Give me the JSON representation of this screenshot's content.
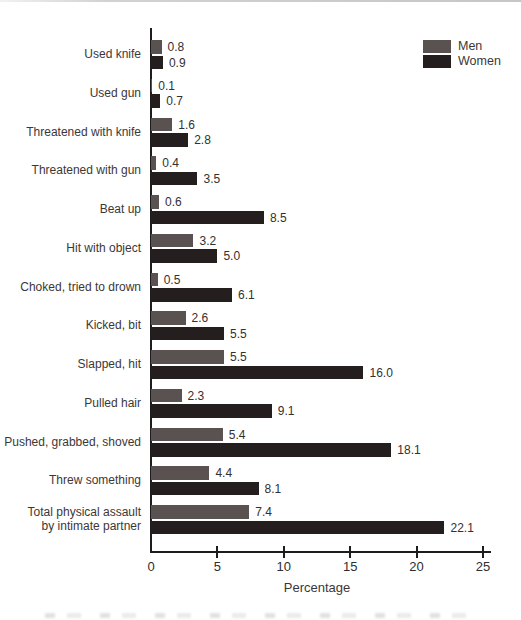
{
  "page": {
    "background": "#ffffff",
    "top_rule_color": "#c6c6c6",
    "axis_color": "#1d1d1d"
  },
  "legend": {
    "items": [
      {
        "label": "Men",
        "color": "#5a5151"
      },
      {
        "label": "Women",
        "color": "#241e1e"
      }
    ]
  },
  "chart_data": {
    "type": "bar",
    "orientation": "horizontal",
    "title": "",
    "xlabel": "Percentage",
    "ylabel": "",
    "xlim": [
      0,
      25
    ],
    "xticks": [
      0,
      5,
      10,
      15,
      20,
      25
    ],
    "grid": false,
    "legend_position": "top-right",
    "value_labels": true,
    "categories": [
      "Used knife",
      "Used gun",
      "Threatened with knife",
      "Threatened with gun",
      "Beat up",
      "Hit with object",
      "Choked, tried to drown",
      "Kicked, bit",
      "Slapped, hit",
      "Pulled hair",
      "Pushed, grabbed, shoved",
      "Threw something",
      "Total physical assault\nby intimate partner"
    ],
    "series": [
      {
        "name": "Men",
        "color": "#5a5151",
        "values": [
          0.8,
          0.1,
          1.6,
          0.4,
          0.6,
          3.2,
          0.5,
          2.6,
          5.5,
          2.3,
          5.4,
          4.4,
          7.4
        ]
      },
      {
        "name": "Women",
        "color": "#241e1e",
        "values": [
          0.9,
          0.7,
          2.8,
          3.5,
          8.5,
          5.0,
          6.1,
          5.5,
          16.0,
          9.1,
          18.1,
          8.1,
          22.1
        ]
      }
    ]
  }
}
